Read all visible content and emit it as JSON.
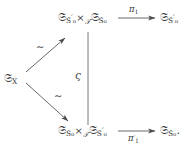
{
  "diagram": {
    "type": "commutative-diagram",
    "ink_color": "#3a3a3c",
    "background": "#ffffff",
    "nodes": {
      "source": {
        "id": "S_X",
        "base": "ѕ",
        "glyph": "𝔖",
        "subscript": "X",
        "text": "𝔖ₓ"
      },
      "top_product": {
        "left_factor_glyph": "𝔖",
        "left_factor_sub": "S",
        "left_factor_prime": "′",
        "left_factor_subsub": "o",
        "operator": "×",
        "operator_sub": "𝒯",
        "right_factor_glyph": "𝔖",
        "right_factor_sub": "S",
        "right_factor_prime": "",
        "right_factor_subsub": "o",
        "text": "𝔖_{S′_o} ×_𝒯 𝔖_{S_o}"
      },
      "bottom_product": {
        "left_factor_glyph": "𝔖",
        "left_factor_sub": "S",
        "left_factor_prime": "",
        "left_factor_subsub": "o",
        "operator": "×",
        "operator_sub": "𝒯",
        "right_factor_glyph": "𝔖",
        "right_factor_sub": "S",
        "right_factor_prime": "′",
        "right_factor_subsub": "o",
        "text": "𝔖_{S_o} ×_𝒯 𝔖_{S′_o}"
      },
      "top_target": {
        "glyph": "𝔖",
        "sub": "S",
        "prime": "′",
        "subsub": "o",
        "text": "𝔖_{S′_o}"
      },
      "bottom_target": {
        "glyph": "𝔖",
        "sub": "S",
        "prime": "",
        "subsub": "o",
        "trailing": ".",
        "text": "𝔖_{S_o}."
      }
    },
    "edges": {
      "upper_diagonal": {
        "label": "∼",
        "from": "source",
        "to": "top_product",
        "style": "solid-arrow"
      },
      "lower_diagonal": {
        "label": "∼",
        "from": "source",
        "to": "bottom_product",
        "style": "solid-arrow"
      },
      "vertical": {
        "label": "ς",
        "from": "top_product",
        "to": "bottom_product",
        "style": "plain-line"
      },
      "top_horizontal": {
        "label_pi": "π",
        "label_sub": "1",
        "label_prime": "",
        "label": "π₁",
        "from": "top_product",
        "to": "top_target",
        "style": "solid-arrow",
        "label_position": "above"
      },
      "bottom_horizontal": {
        "label_pi": "π",
        "label_sub": "1",
        "label_prime": "′",
        "label": "π′₁",
        "from": "bottom_product",
        "to": "bottom_target",
        "style": "solid-arrow",
        "label_position": "below"
      }
    }
  }
}
